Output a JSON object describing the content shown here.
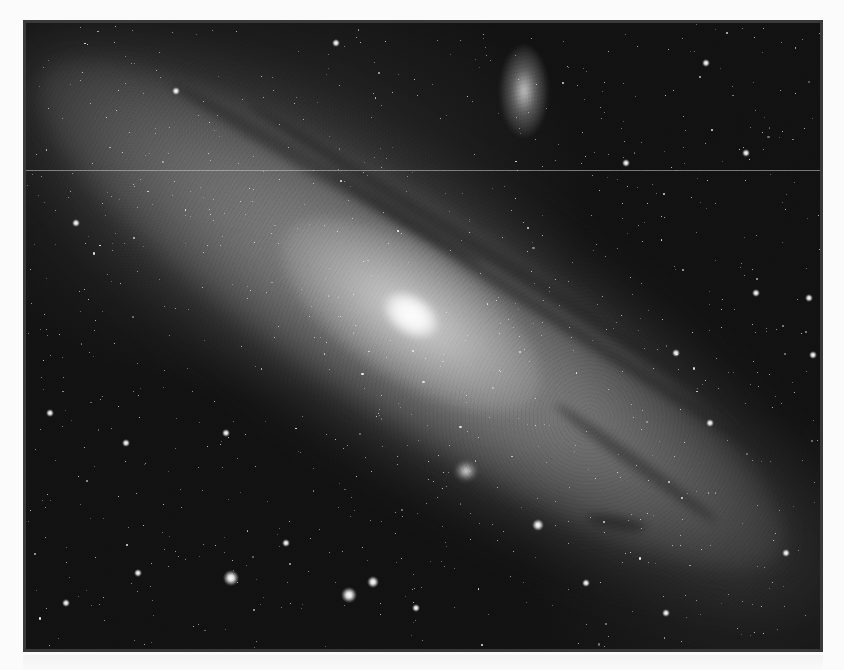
{
  "image": {
    "subject": "Andromeda galaxy (grayscale astrophotograph)",
    "frame": {
      "x": 23,
      "y": 20,
      "width": 800,
      "height": 632,
      "border_color": "#3a3a3a",
      "inner_line_color": "#8a8a8a"
    },
    "colors": {
      "sky": "#121212",
      "halo": "#5a5a5a",
      "disk": "#8c8c8c",
      "bulge": "#cfcfcf",
      "core": "#ffffff",
      "dust": "#1e1e1e",
      "page_background": "#fbfbfb"
    },
    "galaxy": {
      "center": [
        385,
        292
      ],
      "angle_deg": 33,
      "halo": {
        "w": 1020,
        "h": 300
      },
      "disk": {
        "w": 880,
        "h": 210
      },
      "bulge": {
        "w": 300,
        "h": 130
      },
      "core": {
        "w": 60,
        "h": 40
      }
    },
    "dust_lanes": [
      {
        "cx": 460,
        "cy": 230,
        "w": 560,
        "h": 16,
        "angle": 32,
        "opacity": 0.55
      },
      {
        "cx": 520,
        "cy": 290,
        "w": 520,
        "h": 12,
        "angle": 33,
        "opacity": 0.5
      },
      {
        "cx": 300,
        "cy": 150,
        "w": 360,
        "h": 18,
        "angle": 30,
        "opacity": 0.45
      },
      {
        "cx": 610,
        "cy": 440,
        "w": 200,
        "h": 14,
        "angle": 36,
        "opacity": 0.45
      },
      {
        "cx": 590,
        "cy": 500,
        "w": 60,
        "h": 14,
        "angle": 10,
        "opacity": 0.6
      }
    ],
    "satellites": [
      {
        "name": "M110",
        "cx": 498,
        "cy": 68,
        "w": 48,
        "h": 92,
        "brightness": 0.75
      },
      {
        "name": "M32",
        "cx": 440,
        "cy": 448,
        "w": 22,
        "h": 20,
        "brightness": 1.0
      }
    ],
    "scan_line_y": 147,
    "bright_stars": [
      [
        205,
        555,
        4
      ],
      [
        323,
        572,
        4
      ],
      [
        347,
        559,
        3
      ],
      [
        512,
        502,
        3
      ],
      [
        24,
        390,
        2
      ],
      [
        730,
        270,
        2
      ],
      [
        783,
        275,
        2
      ],
      [
        787,
        332,
        2
      ],
      [
        112,
        550,
        2
      ],
      [
        50,
        200,
        2
      ],
      [
        684,
        400,
        2
      ],
      [
        760,
        530,
        2
      ],
      [
        150,
        68,
        2
      ],
      [
        390,
        585,
        2
      ],
      [
        640,
        590,
        2
      ],
      [
        40,
        580,
        2
      ],
      [
        260,
        520,
        2
      ],
      [
        720,
        130,
        2
      ],
      [
        600,
        140,
        2
      ],
      [
        100,
        420,
        2
      ],
      [
        310,
        20,
        2
      ],
      [
        680,
        40,
        2
      ],
      [
        560,
        560,
        2
      ],
      [
        200,
        410,
        2
      ],
      [
        650,
        330,
        2
      ]
    ],
    "random_star_count": 900,
    "random_seed": 42
  }
}
